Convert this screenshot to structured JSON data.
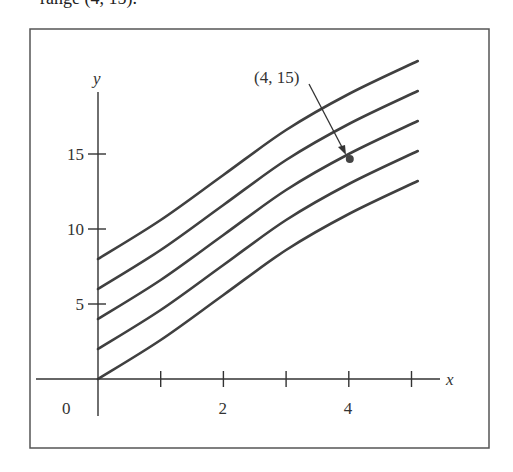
{
  "caption_fragment": "range (4, 15).",
  "chart_data": {
    "type": "line",
    "title": "",
    "xlabel": "x",
    "ylabel": "y",
    "xlim": [
      0,
      5.3
    ],
    "ylim": [
      0,
      21
    ],
    "x_ticks": [
      1,
      2,
      3,
      4,
      5
    ],
    "x_tick_labels": [
      "",
      "2",
      "",
      "4",
      ""
    ],
    "y_ticks": [
      5,
      10,
      15
    ],
    "y_tick_labels": [
      "5",
      "10",
      "15"
    ],
    "origin_label": "0",
    "grid": false,
    "legend": null,
    "x": [
      0,
      1,
      2,
      3,
      4,
      5.1
    ],
    "series": [
      {
        "name": "C = 0",
        "values": [
          0,
          2.6,
          5.6,
          8.6,
          11.0,
          13.2
        ]
      },
      {
        "name": "C = 2",
        "values": [
          2,
          4.6,
          7.6,
          10.6,
          13.0,
          15.2
        ]
      },
      {
        "name": "C = 4",
        "values": [
          4,
          6.6,
          9.6,
          12.6,
          15.0,
          17.2
        ]
      },
      {
        "name": "C = 6",
        "values": [
          6,
          8.6,
          11.6,
          14.6,
          17.0,
          19.2
        ]
      },
      {
        "name": "C = 8",
        "values": [
          8,
          10.6,
          13.6,
          16.6,
          19.0,
          21.2
        ]
      }
    ],
    "annotations": [
      {
        "text": "(4, 15)",
        "point": [
          4,
          15
        ],
        "arrow": true
      }
    ]
  },
  "colors": {
    "curve": "#404040",
    "axis": "#333333",
    "frame": "#555555"
  }
}
